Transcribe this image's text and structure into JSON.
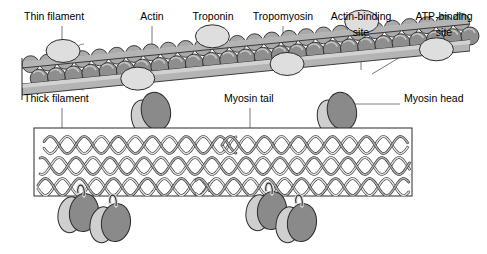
{
  "figure": {
    "background": "#ffffff"
  },
  "labels": {
    "thin_filament": "Thin filament",
    "actin": "Actin",
    "troponin": "Troponin",
    "tropomyosin": "Tropomyosin",
    "actin_binding_site_line1": "Actin-binding",
    "actin_binding_site_line2": "site",
    "atp_binding_site_line1": "ATP-binding",
    "atp_binding_site_line2": "site",
    "thick_filament": "Thick filament",
    "myosin_tail": "Myosin tail",
    "myosin_head": "Myosin head"
  },
  "colors": {
    "outline": "#2b2b2b",
    "actin_bead": "#8e8e8e",
    "actin_bead_back": "#a9a9a9",
    "troponin": "#dedede",
    "tropomyosin": "#b4b4b4",
    "tropomyosin_shade": "#9a9a9a",
    "myosin_head_dark": "#8a8a8a",
    "myosin_head_light": "#cfcfcf",
    "filament_body": "#ffffff",
    "coil_light": "#e2e2e2",
    "coil_mid": "#b0b0b0",
    "leader": "#7a7a7a",
    "text": "#000000"
  },
  "geometry": {
    "thin_filament": {
      "left": 22,
      "right": 470,
      "top": 36,
      "bottom": 90,
      "bead_rows": 2,
      "bead_count_per_row": 26,
      "troponin_count": 6,
      "tropomyosin_strands": 4
    },
    "thick_filament": {
      "left": 34,
      "right": 412,
      "top": 128,
      "bottom": 196,
      "coil_rows": 3
    },
    "myosin_heads_top": [
      {
        "x": 152,
        "y": 112
      },
      {
        "x": 338,
        "y": 112
      }
    ],
    "myosin_heads_bottom": [
      {
        "x": 80,
        "y": 212
      },
      {
        "x": 112,
        "y": 222
      },
      {
        "x": 268,
        "y": 210
      },
      {
        "x": 298,
        "y": 222
      }
    ]
  },
  "chart_data": {
    "type": "diagram",
    "components": [
      {
        "name": "Thin filament",
        "description": "Double helix of actin beads wrapped by tropomyosin strands with troponin complexes"
      },
      {
        "name": "Actin",
        "description": "Globular bead subunits forming two intertwined rows"
      },
      {
        "name": "Troponin",
        "description": "Light ovoid complexes spaced periodically along the thin filament"
      },
      {
        "name": "Tropomyosin",
        "description": "Flat ribbon strands running diagonally over the actin rows"
      },
      {
        "name": "Actin-binding site",
        "description": "Region on the myosin head that contacts actin"
      },
      {
        "name": "ATP-binding site",
        "description": "Region on the myosin head that binds ATP"
      },
      {
        "name": "Thick filament",
        "description": "Bundle of coiled-coil myosin tails"
      },
      {
        "name": "Myosin tail",
        "description": "Long alpha-helical coiled-coil rod"
      },
      {
        "name": "Myosin head",
        "description": "Paired globular heads projecting from the thick filament"
      }
    ]
  }
}
